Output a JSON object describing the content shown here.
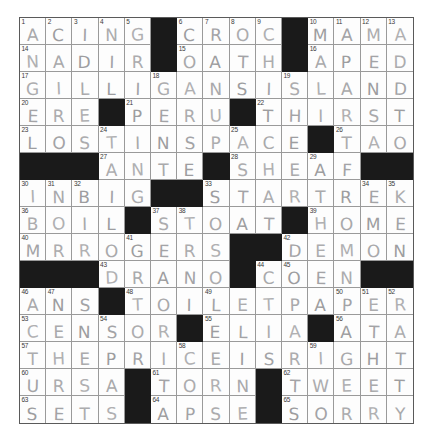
{
  "puzzle": {
    "name": "crossword-grid",
    "columns": 15,
    "rows": 15,
    "block_color": "#1a1a1a",
    "cell_color": "#fdfdfd",
    "grid_line_color": "#9a9a9a",
    "border_color": "#5a5a5a",
    "pencil_color": "#a9a9ab",
    "rows_data": [
      {
        "cells": [
          {
            "number": "1",
            "letter": "A"
          },
          {
            "number": "2",
            "letter": "C"
          },
          {
            "number": "3",
            "letter": "I"
          },
          {
            "number": "4",
            "letter": "N"
          },
          {
            "number": "5",
            "letter": "G"
          },
          {
            "block": true
          },
          {
            "number": "6",
            "letter": "C"
          },
          {
            "number": "7",
            "letter": "R"
          },
          {
            "number": "8",
            "letter": "O"
          },
          {
            "number": "9",
            "letter": "C"
          },
          {
            "block": true
          },
          {
            "number": "10",
            "letter": "M"
          },
          {
            "number": "11",
            "letter": "A"
          },
          {
            "number": "12",
            "letter": "M"
          },
          {
            "number": "13",
            "letter": "A"
          }
        ]
      },
      {
        "cells": [
          {
            "number": "14",
            "letter": "N"
          },
          {
            "letter": "A"
          },
          {
            "letter": "D"
          },
          {
            "letter": "I"
          },
          {
            "letter": "R"
          },
          {
            "block": true
          },
          {
            "number": "15",
            "letter": "O"
          },
          {
            "letter": "A"
          },
          {
            "letter": "T"
          },
          {
            "letter": "H"
          },
          {
            "block": true
          },
          {
            "number": "16",
            "letter": "A"
          },
          {
            "letter": "P"
          },
          {
            "letter": "E"
          },
          {
            "letter": "D"
          }
        ]
      },
      {
        "cells": [
          {
            "number": "17",
            "letter": "G"
          },
          {
            "letter": "I"
          },
          {
            "letter": "L"
          },
          {
            "letter": "L"
          },
          {
            "letter": "I"
          },
          {
            "number": "18",
            "letter": "G"
          },
          {
            "letter": "A"
          },
          {
            "letter": "N"
          },
          {
            "letter": "S"
          },
          {
            "letter": "I"
          },
          {
            "number": "19",
            "letter": "S"
          },
          {
            "letter": "L"
          },
          {
            "letter": "A"
          },
          {
            "letter": "N"
          },
          {
            "letter": "D"
          }
        ]
      },
      {
        "cells": [
          {
            "number": "20",
            "letter": "E"
          },
          {
            "letter": "R"
          },
          {
            "letter": "E"
          },
          {
            "block": true
          },
          {
            "number": "21",
            "letter": "P"
          },
          {
            "letter": "E"
          },
          {
            "letter": "R"
          },
          {
            "letter": "U"
          },
          {
            "block": true
          },
          {
            "number": "22",
            "letter": "T"
          },
          {
            "letter": "H"
          },
          {
            "letter": "I"
          },
          {
            "letter": "R"
          },
          {
            "letter": "S"
          },
          {
            "letter": "T"
          }
        ]
      },
      {
        "cells": [
          {
            "number": "23",
            "letter": "L"
          },
          {
            "letter": "O"
          },
          {
            "letter": "S"
          },
          {
            "number": "24",
            "letter": "T"
          },
          {
            "letter": "I"
          },
          {
            "letter": "N"
          },
          {
            "letter": "S"
          },
          {
            "letter": "P"
          },
          {
            "number": "25",
            "letter": "A"
          },
          {
            "letter": "C"
          },
          {
            "letter": "E"
          },
          {
            "block": true
          },
          {
            "number": "26",
            "letter": "T"
          },
          {
            "letter": "A"
          },
          {
            "letter": "O"
          }
        ]
      },
      {
        "cells": [
          {
            "block": true
          },
          {
            "block": true
          },
          {
            "block": true
          },
          {
            "number": "27",
            "letter": "A"
          },
          {
            "letter": "N"
          },
          {
            "letter": "T"
          },
          {
            "letter": "E"
          },
          {
            "block": true
          },
          {
            "number": "28",
            "letter": "S"
          },
          {
            "letter": "H"
          },
          {
            "letter": "E"
          },
          {
            "number": "29",
            "letter": "A"
          },
          {
            "letter": "F"
          },
          {
            "block": true
          },
          {
            "block": true
          }
        ]
      },
      {
        "cells": [
          {
            "number": "30",
            "letter": "I"
          },
          {
            "number": "31",
            "letter": "N"
          },
          {
            "number": "32",
            "letter": "B"
          },
          {
            "letter": "I"
          },
          {
            "letter": "G"
          },
          {
            "block": true
          },
          {
            "block": true
          },
          {
            "number": "33",
            "letter": "S"
          },
          {
            "letter": "T"
          },
          {
            "letter": "A"
          },
          {
            "letter": "R"
          },
          {
            "letter": "T"
          },
          {
            "letter": "R"
          },
          {
            "number": "34",
            "letter": "E"
          },
          {
            "number": "35",
            "letter": "K"
          }
        ]
      },
      {
        "cells": [
          {
            "number": "36",
            "letter": "B"
          },
          {
            "letter": "O"
          },
          {
            "letter": "I"
          },
          {
            "letter": "L"
          },
          {
            "block": true
          },
          {
            "number": "37",
            "letter": "S"
          },
          {
            "number": "38",
            "letter": "T"
          },
          {
            "letter": "O"
          },
          {
            "letter": "A"
          },
          {
            "letter": "T"
          },
          {
            "block": true
          },
          {
            "number": "39",
            "letter": "H"
          },
          {
            "letter": "O"
          },
          {
            "letter": "M"
          },
          {
            "letter": "E"
          }
        ]
      },
      {
        "cells": [
          {
            "number": "40",
            "letter": "M"
          },
          {
            "letter": "R"
          },
          {
            "letter": "R"
          },
          {
            "letter": "O"
          },
          {
            "number": "41",
            "letter": "G"
          },
          {
            "letter": "E"
          },
          {
            "letter": "R"
          },
          {
            "letter": "S"
          },
          {
            "block": true
          },
          {
            "block": true
          },
          {
            "number": "42",
            "letter": "D"
          },
          {
            "letter": "E"
          },
          {
            "letter": "M"
          },
          {
            "letter": "O"
          },
          {
            "letter": "N"
          }
        ]
      },
      {
        "cells": [
          {
            "block": true
          },
          {
            "block": true
          },
          {
            "block": true
          },
          {
            "number": "43",
            "letter": "D"
          },
          {
            "letter": "R"
          },
          {
            "letter": "A"
          },
          {
            "letter": "N"
          },
          {
            "letter": "O"
          },
          {
            "block": true
          },
          {
            "number": "44",
            "letter": "C"
          },
          {
            "number": "45",
            "letter": "O"
          },
          {
            "letter": "E"
          },
          {
            "letter": "N"
          },
          {
            "block": true
          },
          {
            "block": true
          }
        ]
      },
      {
        "cells": [
          {
            "number": "46",
            "letter": "A"
          },
          {
            "number": "47",
            "letter": "N"
          },
          {
            "letter": "S"
          },
          {
            "block": true
          },
          {
            "number": "48",
            "letter": "T"
          },
          {
            "letter": "O"
          },
          {
            "letter": "I"
          },
          {
            "number": "49",
            "letter": "L"
          },
          {
            "letter": "E"
          },
          {
            "letter": "T"
          },
          {
            "letter": "P"
          },
          {
            "letter": "A"
          },
          {
            "number": "50",
            "letter": "P"
          },
          {
            "number": "51",
            "letter": "E"
          },
          {
            "number": "52",
            "letter": "R"
          }
        ]
      },
      {
        "cells": [
          {
            "number": "53",
            "letter": "C"
          },
          {
            "letter": "E"
          },
          {
            "letter": "N"
          },
          {
            "number": "54",
            "letter": "S"
          },
          {
            "letter": "O"
          },
          {
            "letter": "R"
          },
          {
            "block": true
          },
          {
            "number": "55",
            "letter": "E"
          },
          {
            "letter": "L"
          },
          {
            "letter": "I"
          },
          {
            "letter": "A"
          },
          {
            "block": true
          },
          {
            "number": "56",
            "letter": "A"
          },
          {
            "letter": "T"
          },
          {
            "letter": "A"
          }
        ]
      },
      {
        "cells": [
          {
            "number": "57",
            "letter": "T"
          },
          {
            "letter": "H"
          },
          {
            "letter": "E"
          },
          {
            "letter": "P"
          },
          {
            "letter": "R"
          },
          {
            "letter": "I"
          },
          {
            "number": "58",
            "letter": "C"
          },
          {
            "letter": "E"
          },
          {
            "letter": "I"
          },
          {
            "letter": "S"
          },
          {
            "letter": "R"
          },
          {
            "number": "59",
            "letter": "I"
          },
          {
            "letter": "G"
          },
          {
            "letter": "H"
          },
          {
            "letter": "T"
          }
        ]
      },
      {
        "cells": [
          {
            "number": "60",
            "letter": "U"
          },
          {
            "letter": "R"
          },
          {
            "letter": "S"
          },
          {
            "letter": "A"
          },
          {
            "block": true
          },
          {
            "number": "61",
            "letter": "T"
          },
          {
            "letter": "O"
          },
          {
            "letter": "R"
          },
          {
            "letter": "N"
          },
          {
            "block": true
          },
          {
            "number": "62",
            "letter": "T"
          },
          {
            "letter": "W"
          },
          {
            "letter": "E"
          },
          {
            "letter": "E"
          },
          {
            "letter": "T"
          }
        ]
      },
      {
        "cells": [
          {
            "number": "63",
            "letter": "S"
          },
          {
            "letter": "E"
          },
          {
            "letter": "T"
          },
          {
            "letter": "S"
          },
          {
            "block": true
          },
          {
            "number": "64",
            "letter": "A"
          },
          {
            "letter": "P"
          },
          {
            "letter": "S"
          },
          {
            "letter": "E"
          },
          {
            "block": true
          },
          {
            "number": "65",
            "letter": "S"
          },
          {
            "letter": "O"
          },
          {
            "letter": "R"
          },
          {
            "letter": "R"
          },
          {
            "letter": "Y"
          }
        ]
      }
    ]
  }
}
